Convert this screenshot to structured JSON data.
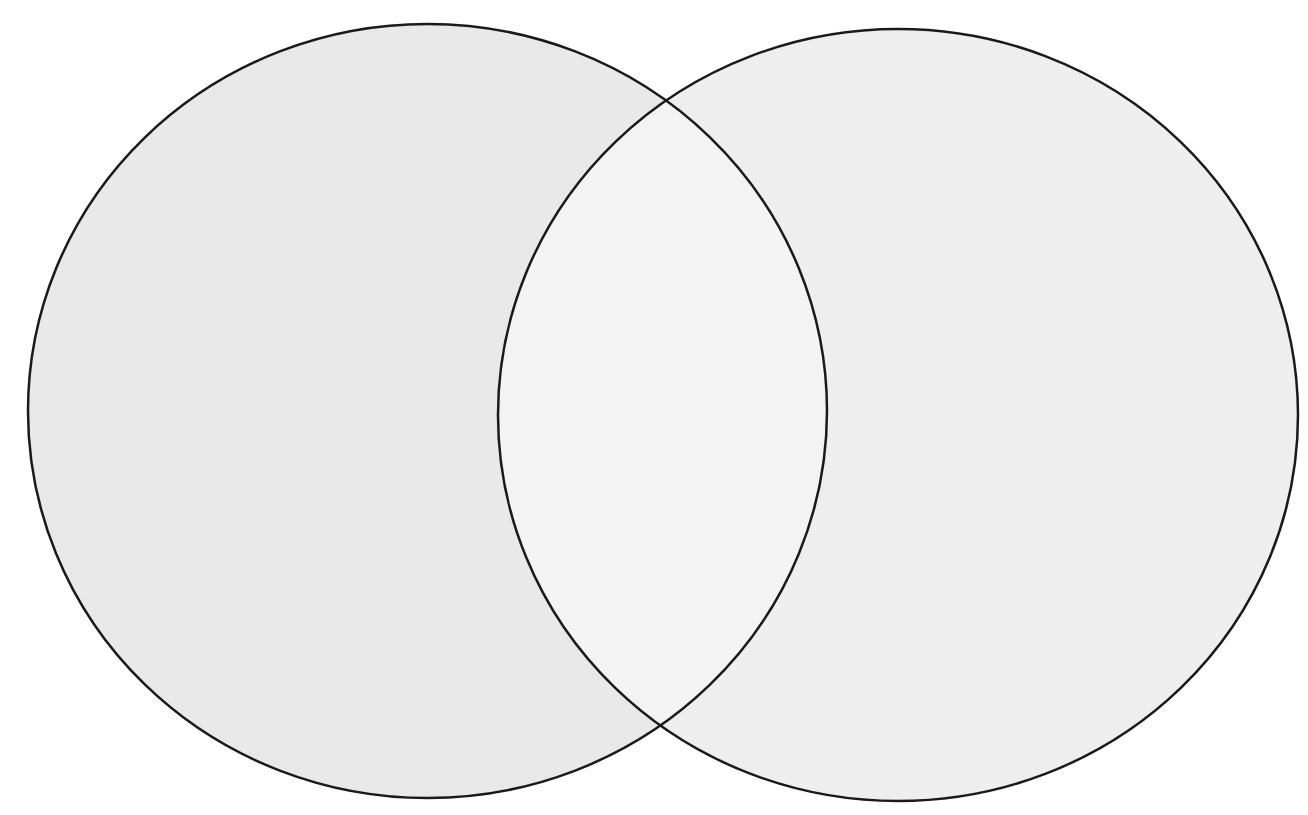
{
  "diagram": {
    "type": "venn",
    "set_count": 2,
    "canvas": {
      "width": 1308,
      "height": 815,
      "background": "#ffffff"
    },
    "stroke": {
      "color": "#1a1a1a",
      "width": 2.5
    },
    "sets": [
      {
        "id": "left-set",
        "label": "",
        "cx": 427.5,
        "cy": 411,
        "rx": 399.5,
        "ry": 387,
        "fill": "#ececec"
      },
      {
        "id": "right-set",
        "label": "",
        "cx": 898,
        "cy": 415,
        "rx": 400,
        "ry": 386,
        "fill": "#f2f2f2"
      }
    ],
    "intersection": {
      "label": "",
      "fill": "#f7f7f7"
    }
  }
}
